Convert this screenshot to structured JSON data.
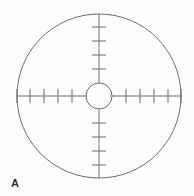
{
  "figure": {
    "panel_label": "A",
    "background_color": "#fefefe",
    "line_color": "#6b6b6b",
    "label_color": "#2b2b2b"
  },
  "chart_data": {
    "type": "scatter",
    "title": "",
    "subtitle": "",
    "xlabel": "",
    "ylabel": "",
    "grid": false,
    "legend_position": "none",
    "annotations": [
      "A"
    ],
    "outer_circle": {
      "center_x": 99,
      "center_y": 96,
      "radius_x": 82,
      "radius_y": 82,
      "stroke": "#6b6b6b",
      "stroke_width": 1
    },
    "center_circle": {
      "center_x": 99,
      "center_y": 96,
      "radius": 13,
      "stroke": "#6b6b6b",
      "stroke_width": 1
    },
    "crosshair": {
      "horizontal_extent": [
        17,
        181
      ],
      "vertical_extent": [
        14,
        178
      ],
      "stroke": "#6b6b6b",
      "stroke_width": 1
    },
    "ticks": {
      "tick_half_length": 7,
      "spacing": 14,
      "arms": [
        {
          "name": "up",
          "count": 4,
          "offsets": [
            27,
            41,
            55,
            69
          ]
        },
        {
          "name": "down",
          "count": 4,
          "offsets": [
            27,
            41,
            55,
            69
          ]
        },
        {
          "name": "left",
          "count": 5,
          "offsets": [
            27,
            41,
            55,
            69,
            82
          ]
        },
        {
          "name": "right",
          "count": 5,
          "offsets": [
            27,
            41,
            55,
            69,
            82
          ]
        }
      ]
    }
  }
}
